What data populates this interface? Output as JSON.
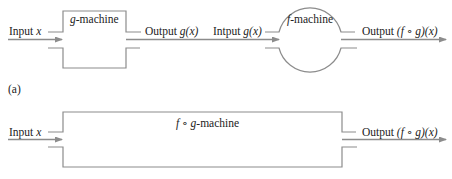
{
  "diagram": {
    "part_a": {
      "caption": "(a)",
      "input_label_prefix": "Input ",
      "input_label_var": "x",
      "g_machine": {
        "name_var": "g",
        "name_suffix": "-machine",
        "shape": "rectangle"
      },
      "g_output_prefix": "Output ",
      "g_output_expr": "g(x)",
      "f_input_prefix": "Intput ",
      "f_input_expr": "g(x)",
      "f_machine": {
        "name_var": "f",
        "name_suffix": "-machine",
        "shape": "circle"
      },
      "f_output_prefix": "Output ",
      "f_output_expr": "(f ∘ g)(x)"
    },
    "part_b": {
      "input_label_prefix": "Input ",
      "input_label_var": "x",
      "machine": {
        "name_var": "f ∘ g",
        "name_suffix": "-machine",
        "shape": "rectangle"
      },
      "output_prefix": "Output ",
      "output_expr": "(f ∘ g)(x)"
    },
    "colors": {
      "line": "#8c8c8c",
      "text": "#222222",
      "background": "#ffffff"
    }
  }
}
